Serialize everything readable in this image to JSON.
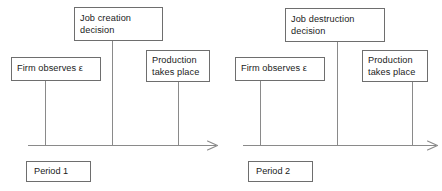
{
  "diagram": {
    "type": "two-period-event-timeline",
    "stroke_color": "#8a8a8a",
    "box_border_color": "#6e6e6e",
    "text_color": "#1b1b1b",
    "background_color": "#ffffff",
    "panels": [
      {
        "id": "period-1",
        "period_label": "Period 1",
        "axis": {
          "x_start": 28,
          "x_end": 216,
          "y": 145,
          "has_arrowhead": true
        },
        "events": [
          {
            "id": "firm-observes-epsilon",
            "lines": [
              "Firm observes ε"
            ],
            "box": {
              "x": 11,
              "y": 57,
              "w": 90,
              "h": 24
            },
            "tick_x": 45
          },
          {
            "id": "job-creation-decision",
            "lines": [
              "Job creation",
              "decision"
            ],
            "box": {
              "x": 74,
              "y": 7,
              "w": 89,
              "h": 34
            },
            "tick_x": 112
          },
          {
            "id": "production-takes-place",
            "lines": [
              "Production",
              "takes place"
            ],
            "box": {
              "x": 146,
              "y": 50,
              "w": 64,
              "h": 32
            },
            "tick_x": 178
          }
        ],
        "period_box": {
          "x": 26,
          "y": 161,
          "w": 65,
          "h": 21
        }
      },
      {
        "id": "period-2",
        "period_label": "Period 2",
        "axis": {
          "x_start": 22,
          "x_end": 215,
          "y": 145,
          "has_arrowhead": true
        },
        "events": [
          {
            "id": "firm-observes-epsilon",
            "lines": [
              "Firm observes ε"
            ],
            "box": {
              "x": 14,
              "y": 57,
              "w": 90,
              "h": 24
            },
            "tick_x": 39
          },
          {
            "id": "job-destruction-decision",
            "lines": [
              "Job destruction",
              "decision"
            ],
            "box": {
              "x": 64,
              "y": 8,
              "w": 100,
              "h": 34
            },
            "tick_x": 116
          },
          {
            "id": "production-takes-place",
            "lines": [
              "Production",
              "takes place"
            ],
            "box": {
              "x": 141,
              "y": 50,
              "w": 66,
              "h": 32
            },
            "tick_x": 191
          }
        ],
        "period_box": {
          "x": 27,
          "y": 161,
          "w": 65,
          "h": 21
        }
      }
    ]
  }
}
